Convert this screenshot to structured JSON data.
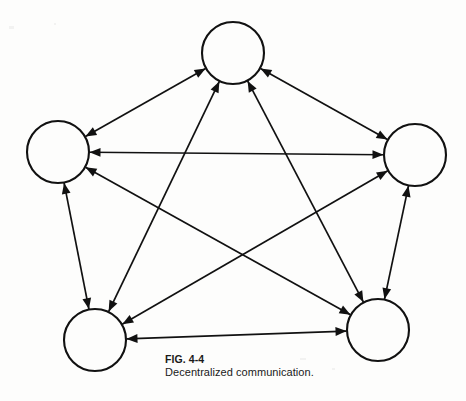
{
  "figure": {
    "caption_label": "FIG. 4-4",
    "caption_text": "Decentralized communication.",
    "background_color": "#fdfdfc",
    "ink_color": "#111111"
  },
  "chart_data": {
    "type": "diagram",
    "diagram_kind": "network-graph",
    "title": "FIG. 4-4",
    "subtitle": "Decentralized communication.",
    "node_radius": 31,
    "node_count": 5,
    "edge_count": 10,
    "all_edges_bidirectional": true,
    "nodes": [
      {
        "id": "top",
        "label": "",
        "x": 233,
        "y": 53,
        "r": 31
      },
      {
        "id": "left",
        "label": "",
        "x": 58,
        "y": 152,
        "r": 31
      },
      {
        "id": "right",
        "label": "",
        "x": 415,
        "y": 155,
        "r": 31
      },
      {
        "id": "bottom-left",
        "label": "",
        "x": 95,
        "y": 340,
        "r": 31
      },
      {
        "id": "bottom-right",
        "label": "",
        "x": 378,
        "y": 330,
        "r": 31
      }
    ],
    "edges": [
      {
        "from": "top",
        "to": "left",
        "arrows": "both"
      },
      {
        "from": "top",
        "to": "right",
        "arrows": "both"
      },
      {
        "from": "top",
        "to": "bottom-left",
        "arrows": "both"
      },
      {
        "from": "top",
        "to": "bottom-right",
        "arrows": "both"
      },
      {
        "from": "left",
        "to": "right",
        "arrows": "both"
      },
      {
        "from": "left",
        "to": "bottom-left",
        "arrows": "both"
      },
      {
        "from": "left",
        "to": "bottom-right",
        "arrows": "both"
      },
      {
        "from": "right",
        "to": "bottom-left",
        "arrows": "both"
      },
      {
        "from": "right",
        "to": "bottom-right",
        "arrows": "both"
      },
      {
        "from": "bottom-left",
        "to": "bottom-right",
        "arrows": "both"
      }
    ]
  }
}
